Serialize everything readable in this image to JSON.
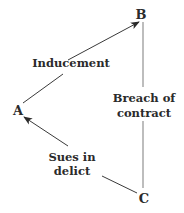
{
  "diagram": {
    "nodes": [
      {
        "id": "A",
        "label": "A"
      },
      {
        "id": "B",
        "label": "B"
      },
      {
        "id": "C",
        "label": "C"
      }
    ],
    "edges": [
      {
        "from": "A",
        "to": "B",
        "label_lines": [
          "Inducement"
        ],
        "directed": true
      },
      {
        "from": "B",
        "to": "C",
        "label_lines": [
          "Breach of",
          "contract"
        ],
        "directed": false
      },
      {
        "from": "C",
        "to": "A",
        "label_lines": [
          "Sues in",
          "delict"
        ],
        "directed": true
      }
    ]
  }
}
